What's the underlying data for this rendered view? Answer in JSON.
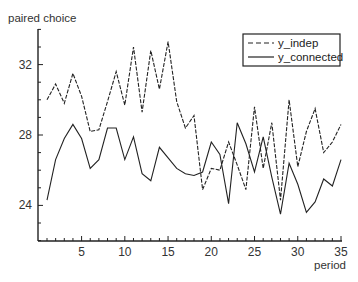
{
  "chart_data": {
    "type": "line",
    "title": "",
    "xlabel": "period",
    "ylabel": "paired choice",
    "x": [
      1,
      2,
      3,
      4,
      5,
      6,
      7,
      8,
      9,
      10,
      11,
      12,
      13,
      14,
      15,
      16,
      17,
      18,
      19,
      20,
      21,
      22,
      23,
      24,
      25,
      26,
      27,
      28,
      29,
      30,
      31,
      32,
      33,
      34,
      35
    ],
    "xticks": [
      5,
      10,
      15,
      20,
      25,
      30,
      35
    ],
    "yticks": [
      24,
      28,
      32
    ],
    "xlim": [
      0,
      35
    ],
    "ylim": [
      22,
      34
    ],
    "grid": false,
    "legend_position": "upper right",
    "series": [
      {
        "name": "y_indep",
        "style": "dashed",
        "values": [
          30.0,
          30.9,
          29.8,
          31.5,
          30.2,
          28.2,
          28.3,
          29.9,
          31.6,
          29.7,
          33.0,
          29.3,
          32.8,
          30.6,
          33.3,
          29.9,
          28.4,
          29.1,
          24.9,
          26.1,
          26.0,
          27.6,
          26.3,
          24.9,
          29.6,
          26.1,
          28.7,
          24.3,
          30.0,
          26.2,
          28.2,
          29.5,
          27.0,
          27.6,
          28.6
        ]
      },
      {
        "name": "y_connected",
        "style": "solid",
        "values": [
          24.3,
          26.6,
          27.8,
          28.6,
          27.8,
          26.1,
          26.6,
          28.4,
          28.4,
          26.6,
          27.9,
          25.8,
          25.4,
          27.3,
          26.7,
          26.1,
          25.8,
          25.7,
          25.9,
          27.6,
          26.9,
          24.1,
          28.7,
          27.5,
          25.9,
          27.9,
          25.6,
          23.5,
          26.4,
          25.2,
          23.6,
          24.2,
          25.5,
          25.1,
          26.6
        ]
      }
    ]
  },
  "labels": {
    "ylabel": "paired choice",
    "xlabel": "period",
    "legend_indep": "y_indep",
    "legend_connected": "y_connected"
  }
}
